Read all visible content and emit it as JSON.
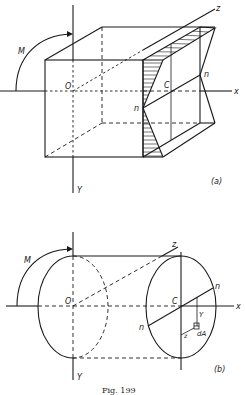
{
  "figure": {
    "caption": "Fig. 199",
    "part_a": {
      "tag": "(a)",
      "labels": {
        "moment": "M",
        "origin": "O",
        "centroid": "C",
        "neutral_axis_1": "n",
        "neutral_axis_2": "n",
        "x_axis": "x",
        "y_axis": "Y",
        "z_axis": "z"
      },
      "description": "Rectangular prism under bending moment M with triangular stress distribution across the end section"
    },
    "part_b": {
      "tag": "(b)",
      "labels": {
        "moment": "M",
        "origin": "O",
        "centroid": "C",
        "neutral_axis_1": "n",
        "neutral_axis_2": "n",
        "x_axis": "x",
        "y_axis": "Y",
        "z_axis": "z",
        "y_distance": "Y",
        "z_distance": "z",
        "area_element": "dA"
      },
      "description": "Cylindrical (elliptical section) bar under bending moment M with neutral axis n-n and area element dA"
    }
  }
}
